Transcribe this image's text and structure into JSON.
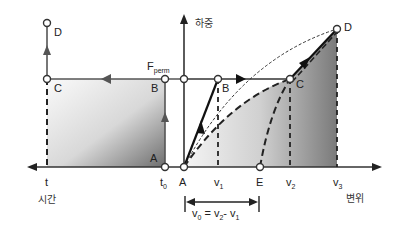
{
  "axes": {
    "y_label": "하중",
    "x_right_label": "변위",
    "x_left_label": "시간"
  },
  "left_panel": {
    "points": {
      "A": "A",
      "B": "B",
      "C": "C",
      "D": "D"
    },
    "ticks": {
      "t": "t",
      "t0_main": "t",
      "t0_sub": "0"
    }
  },
  "right_panel": {
    "points": {
      "A": "A",
      "B": "B",
      "C": "C",
      "D": "D",
      "E": "E"
    },
    "force_label_main": "F",
    "force_label_sub": "perm",
    "ticks": {
      "v1_main": "v",
      "v1_sub": "1",
      "v2_main": "v",
      "v2_sub": "2",
      "v3_main": "v",
      "v3_sub": "3"
    }
  },
  "dimension": {
    "v0_main": "v",
    "v0_sub": "0",
    "eq": " = ",
    "v2_main": "v",
    "v2_sub": "2",
    "minus": "- ",
    "v1_main": "v",
    "v1_sub": "1"
  },
  "colors": {
    "line": "#333333",
    "arrow_left": "#555555",
    "fill_dark": "#6e6e6e",
    "fill_light": "#f2f2f2"
  }
}
